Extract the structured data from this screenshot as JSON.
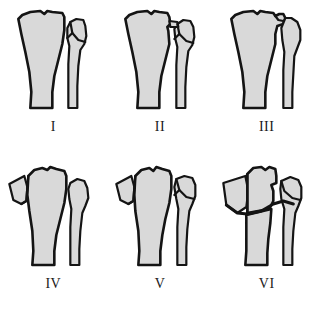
{
  "figure": {
    "panel_count": 6,
    "columns": 3,
    "rows": 2,
    "background_color": "#ffffff",
    "bone_fill_color": "#d9d9d9",
    "outline_color": "#141414"
  },
  "panels": [
    {
      "label": "I",
      "name": "panel-type-1",
      "description": "Lateral tibial plateau split wedge fracture without depression",
      "fragment_count": 1,
      "has_detached_medial_fragment": false,
      "has_lateral_fragment": true,
      "has_transverse_metaphyseal_line": false
    },
    {
      "label": "II",
      "name": "panel-type-2",
      "description": "Lateral plateau split fracture with depression of articular surface",
      "fragment_count": 2,
      "has_detached_medial_fragment": false,
      "has_lateral_fragment": true,
      "has_transverse_metaphyseal_line": false
    },
    {
      "label": "III",
      "name": "panel-type-3",
      "description": "Pure central depression of the lateral plateau articular surface",
      "fragment_count": 1,
      "has_detached_medial_fragment": false,
      "has_lateral_fragment": false,
      "has_transverse_metaphyseal_line": false
    },
    {
      "label": "IV",
      "name": "panel-type-4",
      "description": "Medial tibial plateau fracture with detached medial wedge fragment",
      "fragment_count": 1,
      "has_detached_medial_fragment": true,
      "has_lateral_fragment": false,
      "has_transverse_metaphyseal_line": false
    },
    {
      "label": "V",
      "name": "panel-type-5",
      "description": "Bicondylar fracture involving both medial and lateral plateaus",
      "fragment_count": 2,
      "has_detached_medial_fragment": true,
      "has_lateral_fragment": true,
      "has_transverse_metaphyseal_line": false
    },
    {
      "label": "VI",
      "name": "panel-type-6",
      "description": "Bicondylar fracture with metaphyseal-diaphyseal dissociation",
      "fragment_count": 3,
      "has_detached_medial_fragment": true,
      "has_lateral_fragment": true,
      "has_transverse_metaphyseal_line": true
    }
  ]
}
